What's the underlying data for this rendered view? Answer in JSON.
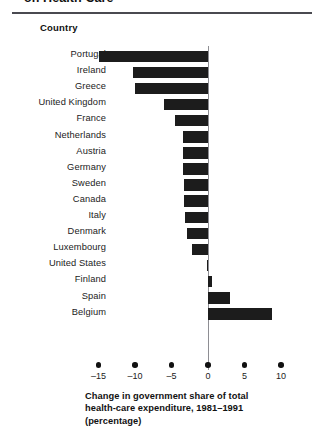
{
  "figure": {
    "title": "on Health Care",
    "column_header": "Country",
    "axis_caption_lines": [
      "Change in government share of total",
      "health-care expenditure, 1981–1991",
      "(percentage)"
    ],
    "bar_color": "#1c1c1c",
    "axis_color": "#8e8e93",
    "rule_color": "#4a4a50"
  },
  "chart_data": {
    "type": "bar",
    "orientation": "horizontal",
    "title": "on Health Care",
    "xlabel": "Change in government share of total health-care expenditure, 1981–1991 (percentage)",
    "ylabel": "Country",
    "xlim": [
      -16.5,
      11.5
    ],
    "xticks": [
      -15,
      -10,
      -5,
      0,
      5,
      10
    ],
    "xtick_labels": [
      "–15",
      "–10",
      "–5",
      "0",
      "5",
      "10"
    ],
    "grid": false,
    "legend": null,
    "categories": [
      "Portugal",
      "Ireland",
      "Greece",
      "United Kingdom",
      "France",
      "Netherlands",
      "Austria",
      "Germany",
      "Sweden",
      "Canada",
      "Italy",
      "Denmark",
      "Luxembourg",
      "United States",
      "Finland",
      "Spain",
      "Belgium"
    ],
    "values": [
      -14.9,
      -10.3,
      -10.0,
      -6.0,
      -4.5,
      -3.4,
      -3.4,
      -3.4,
      -3.3,
      -3.3,
      -3.2,
      -2.9,
      -2.2,
      -0.2,
      0.6,
      3.0,
      8.8
    ]
  }
}
